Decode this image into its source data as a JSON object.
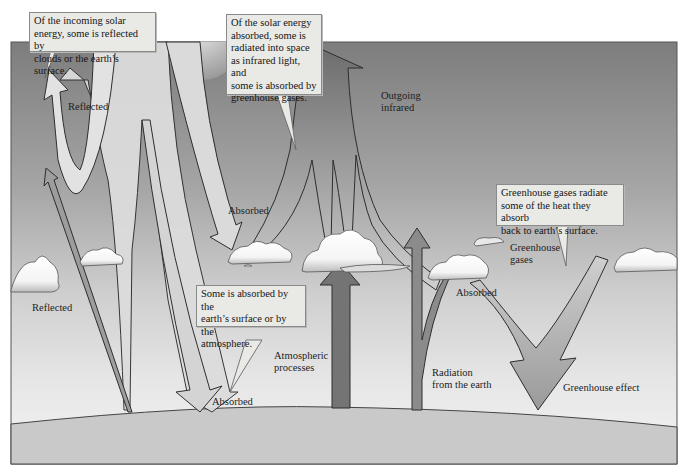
{
  "diagram": {
    "style": "grayscale",
    "colors": {
      "sky_top": "#7f7f7f",
      "sky_bottom": "#f2f2f2",
      "ground": "#c8c8c8",
      "arrow_light": "#d9d9d9",
      "arrow_medium": "#9a9a9a",
      "arrow_dark": "#6f6f6f",
      "callout_bg": "#e9e9e6",
      "outline": "#333333"
    },
    "callouts": [
      {
        "id": "incoming",
        "lines": [
          "Of the incoming solar",
          "energy, some is reflected by",
          "clouds or the earth’s surface."
        ]
      },
      {
        "id": "absorbed_space",
        "lines": [
          "Of the solar energy",
          "absorbed, some is",
          "radiated into space",
          "as infrared light, and",
          "some is absorbed by",
          "greenhouse gases."
        ]
      },
      {
        "id": "surface_atmosphere",
        "lines": [
          "Some is absorbed by the",
          "earth’s surface or by the",
          "atmosphere."
        ]
      },
      {
        "id": "greenhouse_radiate",
        "lines": [
          "Greenhouse gases radiate",
          "some of the heat they absorb",
          "back to earth’s surface."
        ]
      }
    ],
    "labels": {
      "reflected_top": "Reflected",
      "reflected_left": "Reflected",
      "absorbed_cloud": "Absorbed",
      "absorbed_ground": "Absorbed",
      "absorbed_right_cloud": "Absorbed",
      "outgoing_infrared_1": "Outgoing",
      "outgoing_infrared_2": "infrared",
      "atmospheric_1": "Atmospheric",
      "atmospheric_2": "processes",
      "radiation_1": "Radiation",
      "radiation_2": "from the earth",
      "greenhouse_gases_1": "Greenhouse",
      "greenhouse_gases_2": "gases",
      "greenhouse_effect": "Greenhouse effect"
    }
  }
}
